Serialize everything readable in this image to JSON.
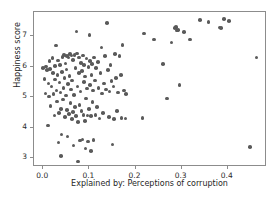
{
  "chart_data": {
    "type": "scatter",
    "title": "",
    "xlabel": "Explained by: Perceptions of corruption",
    "ylabel": "Happiness score",
    "xlim": [
      -0.02,
      0.485
    ],
    "ylim": [
      2.72,
      7.78
    ],
    "xticks": [
      0.0,
      0.1,
      0.2,
      0.3,
      0.4
    ],
    "xtick_labels": [
      "0.0",
      "0.1",
      "0.2",
      "0.3",
      "0.4"
    ],
    "yticks": [
      3,
      4,
      5,
      6,
      7
    ],
    "ytick_labels": [
      "3",
      "4",
      "5",
      "6",
      "7"
    ],
    "grid": false,
    "legend": null,
    "marker": {
      "color": "#5a5a5a",
      "shape": "circle",
      "size": 3.6
    },
    "frame_color": "#8c8c8c",
    "background": "#ffffff",
    "n_points": 153,
    "points": [
      [
        0.0,
        5.95
      ],
      [
        0.003,
        5.6
      ],
      [
        0.005,
        5.12
      ],
      [
        0.006,
        6.0
      ],
      [
        0.008,
        5.88
      ],
      [
        0.01,
        4.08
      ],
      [
        0.011,
        5.45
      ],
      [
        0.012,
        5.02
      ],
      [
        0.014,
        6.18
      ],
      [
        0.015,
        5.92
      ],
      [
        0.016,
        4.72
      ],
      [
        0.018,
        5.35
      ],
      [
        0.02,
        6.28
      ],
      [
        0.021,
        5.78
      ],
      [
        0.022,
        5.1
      ],
      [
        0.024,
        4.4
      ],
      [
        0.025,
        6.02
      ],
      [
        0.026,
        5.58
      ],
      [
        0.028,
        6.68
      ],
      [
        0.029,
        5.22
      ],
      [
        0.03,
        4.86
      ],
      [
        0.031,
        5.72
      ],
      [
        0.032,
        6.2
      ],
      [
        0.033,
        3.52
      ],
      [
        0.034,
        4.48
      ],
      [
        0.035,
        5.48
      ],
      [
        0.036,
        6.05
      ],
      [
        0.037,
        5.15
      ],
      [
        0.038,
        3.08
      ],
      [
        0.039,
        4.62
      ],
      [
        0.04,
        3.78
      ],
      [
        0.041,
        5.82
      ],
      [
        0.042,
        6.32
      ],
      [
        0.043,
        4.92
      ],
      [
        0.044,
        5.3
      ],
      [
        0.045,
        6.38
      ],
      [
        0.046,
        5.62
      ],
      [
        0.047,
        4.35
      ],
      [
        0.048,
        6.1
      ],
      [
        0.049,
        5.05
      ],
      [
        0.05,
        5.9
      ],
      [
        0.051,
        4.58
      ],
      [
        0.052,
        6.35
      ],
      [
        0.053,
        3.72
      ],
      [
        0.054,
        5.42
      ],
      [
        0.055,
        6.3
      ],
      [
        0.056,
        4.45
      ],
      [
        0.057,
        5.7
      ],
      [
        0.058,
        6.4
      ],
      [
        0.059,
        4.8
      ],
      [
        0.06,
        5.25
      ],
      [
        0.061,
        6.36
      ],
      [
        0.062,
        4.28
      ],
      [
        0.063,
        5.55
      ],
      [
        0.064,
        6.22
      ],
      [
        0.065,
        4.52
      ],
      [
        0.066,
        3.42
      ],
      [
        0.067,
        5.08
      ],
      [
        0.068,
        6.38
      ],
      [
        0.069,
        4.68
      ],
      [
        0.07,
        5.95
      ],
      [
        0.071,
        4.38
      ],
      [
        0.072,
        7.15
      ],
      [
        0.073,
        6.42
      ],
      [
        0.074,
        5.35
      ],
      [
        0.075,
        4.18
      ],
      [
        0.076,
        2.9
      ],
      [
        0.077,
        5.78
      ],
      [
        0.078,
        6.3
      ],
      [
        0.079,
        4.75
      ],
      [
        0.08,
        3.58
      ],
      [
        0.081,
        5.18
      ],
      [
        0.082,
        6.12
      ],
      [
        0.083,
        4.55
      ],
      [
        0.084,
        5.85
      ],
      [
        0.085,
        3.62
      ],
      [
        0.086,
        6.36
      ],
      [
        0.087,
        4.42
      ],
      [
        0.088,
        5.5
      ],
      [
        0.089,
        6.05
      ],
      [
        0.09,
        4.22
      ],
      [
        0.091,
        5.68
      ],
      [
        0.092,
        3.32
      ],
      [
        0.093,
        4.95
      ],
      [
        0.094,
        6.26
      ],
      [
        0.095,
        5.28
      ],
      [
        0.096,
        4.4
      ],
      [
        0.097,
        3.55
      ],
      [
        0.098,
        5.98
      ],
      [
        0.099,
        4.62
      ],
      [
        0.1,
        7.02
      ],
      [
        0.101,
        6.18
      ],
      [
        0.102,
        5.4
      ],
      [
        0.103,
        4.38
      ],
      [
        0.104,
        3.25
      ],
      [
        0.105,
        5.72
      ],
      [
        0.106,
        6.08
      ],
      [
        0.107,
        4.85
      ],
      [
        0.108,
        5.22
      ],
      [
        0.109,
        3.6
      ],
      [
        0.11,
        6.3
      ],
      [
        0.112,
        5.55
      ],
      [
        0.113,
        4.42
      ],
      [
        0.115,
        5.95
      ],
      [
        0.117,
        4.68
      ],
      [
        0.119,
        6.15
      ],
      [
        0.12,
        5.3
      ],
      [
        0.122,
        4.3
      ],
      [
        0.124,
        5.78
      ],
      [
        0.126,
        6.62
      ],
      [
        0.128,
        5.12
      ],
      [
        0.13,
        4.48
      ],
      [
        0.132,
        5.45
      ],
      [
        0.134,
        6.35
      ],
      [
        0.136,
        5.25
      ],
      [
        0.138,
        7.42
      ],
      [
        0.14,
        5.88
      ],
      [
        0.142,
        4.35
      ],
      [
        0.144,
        5.18
      ],
      [
        0.146,
        6.05
      ],
      [
        0.148,
        5.52
      ],
      [
        0.15,
        3.45
      ],
      [
        0.152,
        5.35
      ],
      [
        0.154,
        4.28
      ],
      [
        0.156,
        6.4
      ],
      [
        0.158,
        5.62
      ],
      [
        0.16,
        4.55
      ],
      [
        0.162,
        5.15
      ],
      [
        0.165,
        6.35
      ],
      [
        0.168,
        5.72
      ],
      [
        0.17,
        4.32
      ],
      [
        0.172,
        6.7
      ],
      [
        0.175,
        5.22
      ],
      [
        0.178,
        4.3
      ],
      [
        0.18,
        5.1
      ],
      [
        0.215,
        4.32
      ],
      [
        0.218,
        7.08
      ],
      [
        0.24,
        6.88
      ],
      [
        0.26,
        6.08
      ],
      [
        0.268,
        4.95
      ],
      [
        0.278,
        6.78
      ],
      [
        0.285,
        7.25
      ],
      [
        0.288,
        7.3
      ],
      [
        0.29,
        7.18
      ],
      [
        0.292,
        7.2
      ],
      [
        0.295,
        5.4
      ],
      [
        0.305,
        7.12
      ],
      [
        0.318,
        6.88
      ],
      [
        0.34,
        7.52
      ],
      [
        0.358,
        7.45
      ],
      [
        0.382,
        7.28
      ],
      [
        0.385,
        7.25
      ],
      [
        0.392,
        7.55
      ],
      [
        0.402,
        7.48
      ],
      [
        0.448,
        3.38
      ],
      [
        0.462,
        6.3
      ]
    ]
  }
}
